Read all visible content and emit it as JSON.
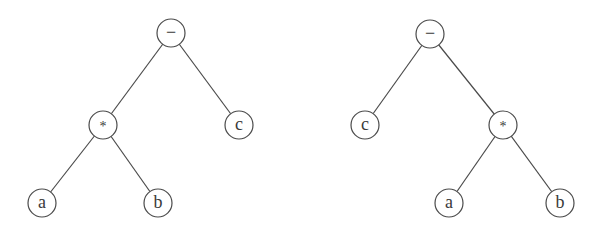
{
  "diagram": {
    "title": "",
    "trees": [
      {
        "id": "left-tree",
        "expression": "(a * b) - c",
        "nodes": [
          {
            "id": "L-root",
            "label": "−",
            "x": 171,
            "y": 33
          },
          {
            "id": "L-mul",
            "label": "*",
            "x": 103,
            "y": 125
          },
          {
            "id": "L-c",
            "label": "c",
            "x": 239,
            "y": 125
          },
          {
            "id": "L-a",
            "label": "a",
            "x": 42,
            "y": 203
          },
          {
            "id": "L-b",
            "label": "b",
            "x": 158,
            "y": 203
          }
        ],
        "edges": [
          [
            "L-root",
            "L-mul"
          ],
          [
            "L-root",
            "L-c"
          ],
          [
            "L-mul",
            "L-a"
          ],
          [
            "L-mul",
            "L-b"
          ]
        ]
      },
      {
        "id": "right-tree",
        "expression": "c - (a * b)",
        "nodes": [
          {
            "id": "R-root",
            "label": "−",
            "x": 430,
            "y": 34
          },
          {
            "id": "R-c",
            "label": "c",
            "x": 365,
            "y": 125
          },
          {
            "id": "R-mul",
            "label": "*",
            "x": 503,
            "y": 125
          },
          {
            "id": "R-a",
            "label": "a",
            "x": 449,
            "y": 203
          },
          {
            "id": "R-b",
            "label": "b",
            "x": 560,
            "y": 203
          }
        ],
        "edges": [
          [
            "R-root",
            "R-c"
          ],
          [
            "R-root",
            "R-mul"
          ],
          [
            "R-mul",
            "R-a"
          ],
          [
            "R-mul",
            "R-b"
          ]
        ]
      }
    ],
    "node_radius": 14,
    "colors": {
      "stroke": "#4a4a4a",
      "text": "#3a3a3a",
      "background": "#ffffff"
    }
  }
}
